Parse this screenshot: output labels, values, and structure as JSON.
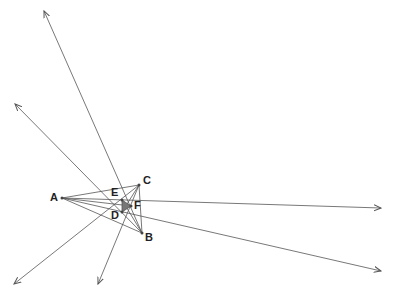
{
  "diagram": {
    "points": {
      "A": {
        "label": "A",
        "x": 62,
        "y": 198,
        "lx": 50,
        "ly": 192
      },
      "B": {
        "label": "B",
        "x": 142,
        "y": 233,
        "lx": 145,
        "ly": 232
      },
      "C": {
        "label": "C",
        "x": 139,
        "y": 185,
        "lx": 143,
        "ly": 175
      },
      "D": {
        "label": "D",
        "x": 122,
        "y": 212,
        "lx": 111,
        "ly": 211
      },
      "E": {
        "label": "E",
        "x": 122,
        "y": 200,
        "lx": 111,
        "ly": 187
      },
      "F": {
        "label": "F",
        "x": 131,
        "y": 206,
        "lx": 134,
        "ly": 201
      }
    },
    "colors": {
      "line": "#555555",
      "shade": "#777777",
      "label": "#222222"
    }
  }
}
